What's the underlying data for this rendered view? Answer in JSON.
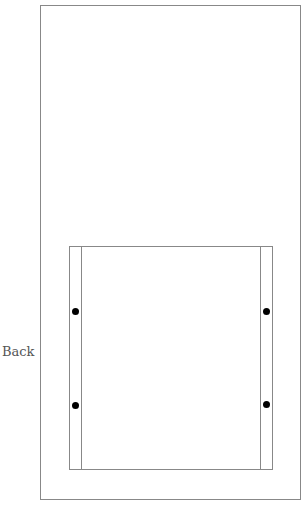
{
  "diagram": {
    "label": "Back",
    "dots": 4,
    "colors": {
      "line": "#888888",
      "dot": "#000000",
      "text": "#555555"
    }
  }
}
